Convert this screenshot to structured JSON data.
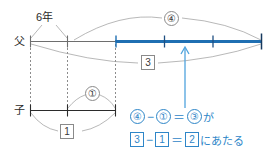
{
  "diagram": {
    "colors": {
      "blue": "#2e86c8",
      "blue_bar": "#1f6fb2",
      "gray_line": "#6e6e6e",
      "gray_thin": "#9a9a9a",
      "text": "#2b2b2b"
    },
    "rows": [
      {
        "id": "father",
        "label": "父"
      },
      {
        "id": "child",
        "label": "子"
      }
    ],
    "years_label": "6年",
    "father_total_marker": "④",
    "father_boxed_marker": "3",
    "child_circled_marker": "①",
    "child_boxed_marker": "1",
    "father_segment_ticks": 3
  },
  "equations": [
    {
      "id": "ratio-equation",
      "terms": [
        {
          "kind": "circled",
          "text": "④"
        },
        {
          "kind": "op",
          "text": "−"
        },
        {
          "kind": "circled",
          "text": "①"
        },
        {
          "kind": "op",
          "text": "＝"
        },
        {
          "kind": "circled",
          "text": "③"
        },
        {
          "kind": "tail",
          "text": "が"
        }
      ]
    },
    {
      "id": "boxed-equation",
      "terms": [
        {
          "kind": "boxed",
          "text": "3"
        },
        {
          "kind": "op",
          "text": "−"
        },
        {
          "kind": "boxed",
          "text": "1"
        },
        {
          "kind": "op",
          "text": "＝"
        },
        {
          "kind": "boxed",
          "text": "2"
        },
        {
          "kind": "tail",
          "text": "にあたる"
        }
      ]
    }
  ]
}
